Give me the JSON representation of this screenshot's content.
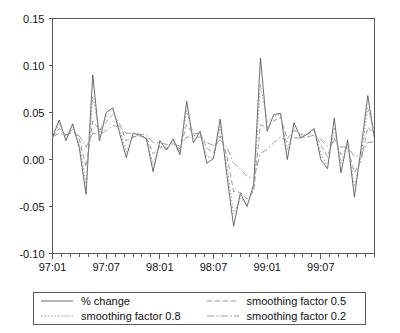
{
  "chart_data": {
    "type": "line",
    "title": "",
    "xlabel": "",
    "ylabel": "",
    "ylim": [
      -0.1,
      0.15
    ],
    "yticks": [
      "0.15",
      "0.10",
      "0.05",
      "0.00",
      "-0.05",
      "-0.10"
    ],
    "ytick_values": [
      0.15,
      0.1,
      0.05,
      0.0,
      -0.05,
      -0.1
    ],
    "xticks": [
      "97:01",
      "97:07",
      "98:01",
      "98:07",
      "99:01",
      "99:07"
    ],
    "xtick_indices": [
      0,
      6,
      12,
      18,
      24,
      30
    ],
    "x_minor_tick_count": 36,
    "grid": false,
    "legend_position": "below",
    "series": [
      {
        "name": "% change",
        "style": "solid",
        "color": "#595959",
        "values": [
          0.024,
          0.042,
          0.02,
          0.038,
          0.012,
          -0.037,
          0.09,
          0.02,
          0.05,
          0.055,
          0.028,
          0.002,
          0.028,
          0.026,
          0.022,
          -0.013,
          0.02,
          0.01,
          0.022,
          0.005,
          0.062,
          0.018,
          0.03,
          -0.004,
          0.001,
          0.043,
          -0.017,
          -0.071,
          -0.036,
          -0.05,
          -0.026,
          0.108,
          0.03,
          0.048,
          0.049,
          0.0,
          0.039,
          0.023,
          0.027,
          0.033,
          0.0,
          -0.01,
          0.044,
          -0.014,
          0.021,
          -0.04,
          0.012,
          0.068,
          0.022
        ]
      },
      {
        "name": "smoothing factor 0.8",
        "style": "dotted",
        "color": "#8c8c8c",
        "values": [
          0.024,
          0.038,
          0.024,
          0.035,
          0.017,
          -0.026,
          0.067,
          0.029,
          0.046,
          0.053,
          0.033,
          0.008,
          0.024,
          0.026,
          0.023,
          -0.006,
          0.015,
          0.011,
          0.02,
          0.008,
          0.052,
          0.025,
          0.029,
          0.003,
          0.001,
          0.035,
          -0.007,
          -0.058,
          -0.041,
          -0.048,
          -0.031,
          0.08,
          0.04,
          0.046,
          0.048,
          0.01,
          0.033,
          0.025,
          0.027,
          0.032,
          0.006,
          -0.007,
          0.034,
          -0.004,
          0.016,
          -0.029,
          0.004,
          0.055,
          0.029
        ]
      },
      {
        "name": "smoothing factor 0.5",
        "style": "dashed",
        "color": "#8c8c8c",
        "values": [
          0.024,
          0.033,
          0.026,
          0.032,
          0.022,
          -0.008,
          0.041,
          0.031,
          0.04,
          0.048,
          0.038,
          0.02,
          0.024,
          0.025,
          0.024,
          0.006,
          0.013,
          0.012,
          0.017,
          0.011,
          0.037,
          0.027,
          0.029,
          0.012,
          0.007,
          0.025,
          0.004,
          -0.034,
          -0.035,
          -0.042,
          -0.034,
          0.037,
          0.034,
          0.041,
          0.045,
          0.022,
          0.031,
          0.027,
          0.027,
          0.03,
          0.015,
          0.003,
          0.023,
          0.005,
          0.013,
          -0.014,
          -0.001,
          0.034,
          0.028
        ]
      },
      {
        "name": "smoothing factor 0.2",
        "style": "dashdot",
        "color": "#8c8c8c",
        "values": [
          0.024,
          0.028,
          0.026,
          0.029,
          0.025,
          0.013,
          0.028,
          0.026,
          0.031,
          0.036,
          0.035,
          0.028,
          0.028,
          0.027,
          0.026,
          0.018,
          0.018,
          0.016,
          0.017,
          0.014,
          0.024,
          0.023,
          0.024,
          0.018,
          0.015,
          0.021,
          0.013,
          -0.004,
          -0.01,
          -0.018,
          -0.02,
          0.006,
          0.011,
          0.018,
          0.024,
          0.019,
          0.023,
          0.023,
          0.024,
          0.026,
          0.021,
          0.014,
          0.02,
          0.013,
          0.014,
          0.003,
          0.005,
          0.018,
          0.019
        ]
      }
    ]
  },
  "legend": {
    "entries": [
      {
        "label": "% change",
        "style": "solid"
      },
      {
        "label": "smoothing factor 0.5",
        "style": "dashed"
      },
      {
        "label": "smoothing factor 0.8",
        "style": "dotted"
      },
      {
        "label": "smoothing factor 0.2",
        "style": "dashdot"
      }
    ]
  },
  "colors": {
    "axis": "#5a5a5a",
    "primary_series": "#595959",
    "smoothed_series": "#8c8c8c",
    "background": "#ffffff",
    "text": "#111111"
  }
}
